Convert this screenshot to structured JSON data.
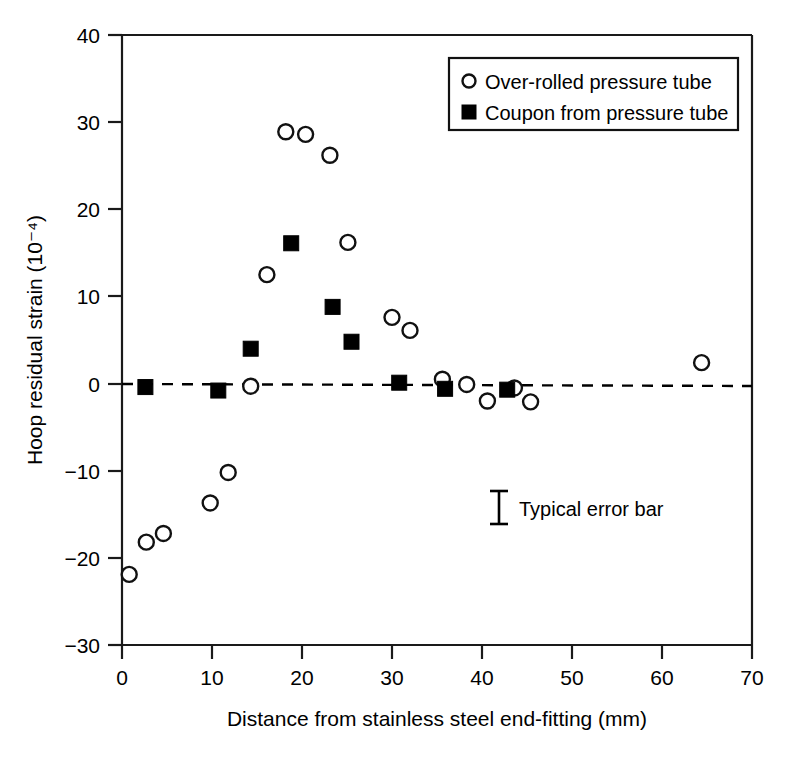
{
  "chart_data": {
    "type": "scatter",
    "title": "",
    "xlabel": "Distance from stainless steel end-fitting (mm)",
    "ylabel": "Hoop residual strain (10⁻⁴)",
    "xlim": [
      0,
      70
    ],
    "ylim": [
      -30,
      40
    ],
    "xticks": [
      "0",
      "10",
      "20",
      "30",
      "40",
      "50",
      "60",
      "70"
    ],
    "xtick_values": [
      0,
      10,
      20,
      30,
      40,
      50,
      60,
      70
    ],
    "yticks": [
      "40",
      "30",
      "20",
      "10",
      "0",
      "−10",
      "−20",
      "−30"
    ],
    "ytick_values": [
      40,
      30,
      20,
      10,
      0,
      -10,
      -20,
      -30
    ],
    "grid": false,
    "legend_position": "top-right",
    "reference_line": {
      "y": 0,
      "style": "dashed",
      "label": "zero strain"
    },
    "series": [
      {
        "name": "Over-rolled pressure tube",
        "marker": "open-circle",
        "color": "#000000",
        "points": [
          {
            "x": 0.8,
            "y": -21.9
          },
          {
            "x": 2.7,
            "y": -18.2
          },
          {
            "x": 4.6,
            "y": -17.2
          },
          {
            "x": 9.8,
            "y": -13.7
          },
          {
            "x": 11.8,
            "y": -10.2
          },
          {
            "x": 14.3,
            "y": -0.3
          },
          {
            "x": 16.1,
            "y": 12.5
          },
          {
            "x": 18.2,
            "y": 28.9
          },
          {
            "x": 20.4,
            "y": 28.6
          },
          {
            "x": 23.1,
            "y": 26.2
          },
          {
            "x": 25.1,
            "y": 16.2
          },
          {
            "x": 30.0,
            "y": 7.6
          },
          {
            "x": 32.0,
            "y": 6.1
          },
          {
            "x": 35.6,
            "y": 0.5
          },
          {
            "x": 38.3,
            "y": -0.1
          },
          {
            "x": 40.6,
            "y": -2.0
          },
          {
            "x": 43.6,
            "y": -0.5
          },
          {
            "x": 45.4,
            "y": -2.1
          },
          {
            "x": 64.4,
            "y": 2.4
          }
        ]
      },
      {
        "name": "Coupon from pressure tube",
        "marker": "filled-square",
        "color": "#000000",
        "points": [
          {
            "x": 2.6,
            "y": -0.4
          },
          {
            "x": 10.7,
            "y": -0.8
          },
          {
            "x": 14.3,
            "y": 4.0
          },
          {
            "x": 18.8,
            "y": 16.1
          },
          {
            "x": 23.4,
            "y": 8.8
          },
          {
            "x": 25.5,
            "y": 4.8
          },
          {
            "x": 30.8,
            "y": 0.1
          },
          {
            "x": 35.9,
            "y": -0.6
          },
          {
            "x": 42.8,
            "y": -0.7
          }
        ]
      }
    ],
    "annotations": [
      {
        "name": "typical-error-bar",
        "label": "Typical error bar",
        "x": 36.3,
        "y": -13.9,
        "half_height": 1.9
      }
    ]
  },
  "legend": {
    "entries": [
      {
        "marker": "open-circle",
        "label": "Over-rolled pressure tube"
      },
      {
        "marker": "filled-square",
        "label": "Coupon from pressure tube"
      }
    ]
  }
}
